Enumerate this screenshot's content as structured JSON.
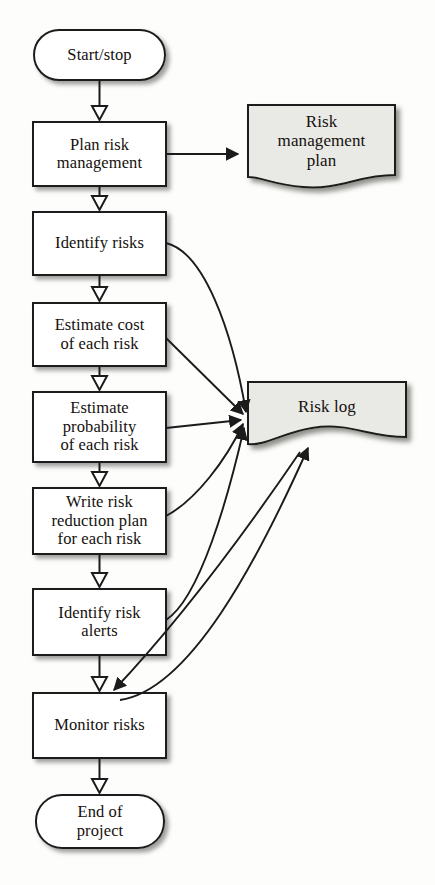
{
  "diagram": {
    "colors": {
      "stroke": "#1b1b1b",
      "process_fill": "#ffffff",
      "document_fill": "#e9e9e6",
      "text": "#15100d",
      "shadow": "#9a9a97",
      "background": "#fdfdfc"
    },
    "nodes": [
      {
        "id": "start",
        "type": "terminal",
        "label": "Start/stop",
        "lines": [
          "Start/stop"
        ]
      },
      {
        "id": "plan",
        "type": "process",
        "label": "Plan risk management",
        "lines": [
          "Plan risk",
          "management"
        ]
      },
      {
        "id": "identify",
        "type": "process",
        "label": "Identify risks",
        "lines": [
          "Identify risks"
        ]
      },
      {
        "id": "cost",
        "type": "process",
        "label": "Estimate cost of each risk",
        "lines": [
          "Estimate cost",
          "of each risk"
        ]
      },
      {
        "id": "probability",
        "type": "process",
        "label": "Estimate probability of each risk",
        "lines": [
          "Estimate",
          "probability",
          "of each risk"
        ]
      },
      {
        "id": "reduction",
        "type": "process",
        "label": "Write risk reduction plan for each risk",
        "lines": [
          "Write risk",
          "reduction plan",
          "for each risk"
        ]
      },
      {
        "id": "alerts",
        "type": "process",
        "label": "Identify risk alerts",
        "lines": [
          "Identify risk",
          "alerts"
        ]
      },
      {
        "id": "monitor",
        "type": "process",
        "label": "Monitor risks",
        "lines": [
          "Monitor risks"
        ]
      },
      {
        "id": "end",
        "type": "terminal",
        "label": "End of project",
        "lines": [
          "End of",
          "project"
        ]
      },
      {
        "id": "rm-plan",
        "type": "document",
        "label": "Risk management plan",
        "lines": [
          "Risk",
          "management",
          "plan"
        ]
      },
      {
        "id": "risk-log",
        "type": "document",
        "label": "Risk log",
        "lines": [
          "Risk log"
        ]
      }
    ],
    "edges": [
      {
        "from": "start",
        "to": "plan",
        "head": "hollow"
      },
      {
        "from": "plan",
        "to": "identify",
        "head": "hollow"
      },
      {
        "from": "identify",
        "to": "cost",
        "head": "hollow"
      },
      {
        "from": "cost",
        "to": "probability",
        "head": "hollow"
      },
      {
        "from": "probability",
        "to": "reduction",
        "head": "hollow"
      },
      {
        "from": "reduction",
        "to": "alerts",
        "head": "hollow"
      },
      {
        "from": "alerts",
        "to": "monitor",
        "head": "hollow"
      },
      {
        "from": "monitor",
        "to": "end",
        "head": "hollow"
      },
      {
        "from": "plan",
        "to": "rm-plan",
        "head": "solid"
      },
      {
        "from": "identify",
        "to": "risk-log",
        "head": "solid"
      },
      {
        "from": "cost",
        "to": "risk-log",
        "head": "solid"
      },
      {
        "from": "probability",
        "to": "risk-log",
        "head": "solid"
      },
      {
        "from": "reduction",
        "to": "risk-log",
        "head": "solid"
      },
      {
        "from": "alerts",
        "to": "risk-log",
        "head": "solid"
      },
      {
        "from": "monitor",
        "to": "risk-log",
        "head": "solid"
      },
      {
        "from": "risk-log",
        "to": "monitor",
        "head": "solid"
      }
    ]
  }
}
